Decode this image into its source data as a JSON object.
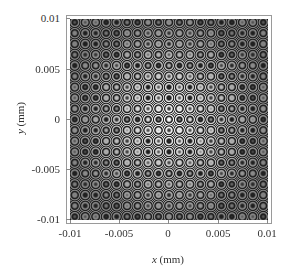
{
  "chart_data": {
    "type": "heatmap",
    "title": "",
    "xlabel": "x (mm)",
    "ylabel": "y (mm)",
    "xlim": [
      -0.01,
      0.01
    ],
    "ylim": [
      -0.01,
      0.01
    ],
    "x_ticks": [
      "-0.01",
      "-0.005",
      "0",
      "0.005",
      "0.01"
    ],
    "y_ticks": [
      "0.01",
      "0.005",
      "0",
      "-0.005",
      "-0.01"
    ],
    "x_tick_values": [
      -0.01,
      -0.005,
      0,
      0.005,
      0.01
    ],
    "y_tick_values": [
      0.01,
      0.005,
      0,
      -0.005,
      -0.01
    ],
    "colormap": "grayscale",
    "center": [
      0,
      0
    ],
    "pattern": {
      "intensity_formula": "contrast(r) * cos^2(k * r^2) + floor",
      "k_per_mm2": 14700000,
      "contrast_center": 1.0,
      "contrast_edge": 0.45,
      "floor_gray": 0.12,
      "center_intensity": "bright",
      "first_dark_ring_radius_mm": 0.001,
      "ring_count_visible": 8
    },
    "grid": false,
    "legend": null
  },
  "axes": {
    "xlabel_var": "x",
    "xlabel_unit": " (mm)",
    "ylabel_var": "y",
    "ylabel_unit": " (mm)"
  }
}
